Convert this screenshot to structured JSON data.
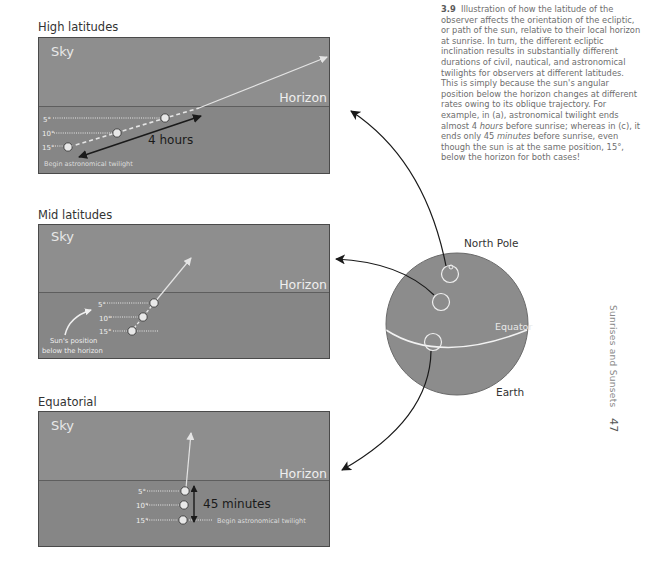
{
  "figure": {
    "number": "3.9",
    "caption": {
      "part1": "Illustration of how the latitude of the observer affects the orientation of the ecliptic, or path of the sun, relative to their local horizon at sunrise. In turn, the different ecliptic inclination results in substantially different durations of civil, nautical, and astronomical twilights for observers at different latitudes. This is simply because the sun's angular position below the horizon changes at different rates owing to its oblique trajectory. For example, in (a), astronomical twilight ends almost 4 ",
      "em1": "hours",
      "part2": " before sunrise; whereas in (c), it ends only 45 ",
      "em2": "minutes",
      "part3": " before sunrise, even though the sun is at the same position, 15°, below the horizon for both cases!"
    }
  },
  "panels": [
    {
      "title": "High latitudes",
      "sky_label": "Sky",
      "horizon_label": "Horizon",
      "degrees": [
        "5°",
        "10°",
        "15°"
      ],
      "duration_label": "4 hours",
      "twilight_label": "Begin astronomical twilight"
    },
    {
      "title": "Mid latitudes",
      "sky_label": "Sky",
      "horizon_label": "Horizon",
      "degrees": [
        "5°",
        "10°",
        "15°"
      ],
      "annotation": [
        "Sun's position",
        "below the horizon"
      ]
    },
    {
      "title": "Equatorial",
      "sky_label": "Sky",
      "horizon_label": "Horizon",
      "degrees": [
        "5°",
        "10°",
        "15°"
      ],
      "duration_label": "45 minutes",
      "twilight_label": "Begin astronomical twilight"
    }
  ],
  "earth": {
    "north_pole_label": "North Pole",
    "equator_label": "Equator",
    "earth_label": "Earth"
  },
  "page": {
    "running_head": "Sunrises and Sunsets",
    "number": "47"
  },
  "colors": {
    "sky": "#8e8e8e",
    "ground": "#868686",
    "earth": "#8c8c8c",
    "sun": "#e0e0e0",
    "arrow": "#222222",
    "light_arrow": "#dcdcdc"
  }
}
